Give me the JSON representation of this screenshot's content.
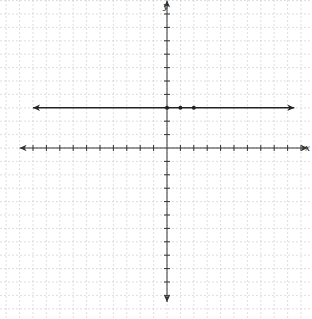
{
  "chart_data": {
    "type": "line",
    "title": "",
    "xlabel": "x",
    "ylabel": "y",
    "xlim": [
      -11,
      10.5
    ],
    "ylim": [
      -11.5,
      11
    ],
    "grid": true,
    "tick_step": 1,
    "series": [
      {
        "name": "y = 3",
        "kind": "horizontal-line",
        "y": 3,
        "x_range": [
          -10,
          9.5
        ],
        "arrows": "both",
        "points": [
          {
            "x": 0,
            "y": 3
          },
          {
            "x": 1,
            "y": 3
          },
          {
            "x": 2,
            "y": 3
          }
        ]
      }
    ]
  },
  "colors": {
    "grid": "#c8c8c8",
    "axis": "#333333",
    "line": "#222222"
  }
}
